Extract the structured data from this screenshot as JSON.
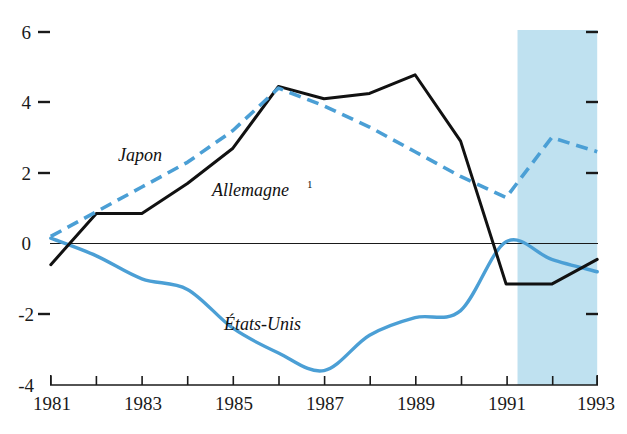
{
  "chart_data": {
    "type": "line",
    "title": "",
    "subtitle": "",
    "xlabel": "",
    "ylabel": "",
    "xlim": [
      1981,
      1993
    ],
    "ylim": [
      -4,
      6
    ],
    "grid": false,
    "legend_position": "inline-annotations",
    "x": [
      1981,
      1982,
      1983,
      1984,
      1985,
      1986,
      1987,
      1988,
      1989,
      1990,
      1991,
      1992,
      1993
    ],
    "xtick_labels": [
      "1981",
      "1983",
      "1985",
      "1987",
      "1989",
      "1991",
      "1993"
    ],
    "xtick_values": [
      1981,
      1983,
      1985,
      1987,
      1989,
      1991,
      1993
    ],
    "ytick_labels": [
      "6",
      "4",
      "2",
      "0",
      "-2",
      "-4"
    ],
    "ytick_values": [
      6,
      4,
      2,
      0,
      -2,
      -4
    ],
    "series": [
      {
        "name": "Japon",
        "style": "dashed",
        "color": "#4b9fd5",
        "values": [
          0.2,
          0.9,
          1.6,
          2.3,
          3.2,
          4.4,
          3.9,
          3.3,
          2.6,
          1.9,
          1.3,
          3.0,
          2.6
        ]
      },
      {
        "name": "Allemagne",
        "footnote": "1",
        "style": "solid",
        "color": "#111111",
        "values": [
          -0.6,
          0.85,
          0.85,
          1.7,
          2.7,
          4.45,
          4.1,
          4.25,
          4.78,
          2.9,
          -1.15,
          -1.15,
          -0.45
        ]
      },
      {
        "name": "États-Unis",
        "style": "solid",
        "color": "#4b9fd5",
        "values": [
          0.15,
          -0.35,
          -1.0,
          -1.3,
          -2.4,
          -3.1,
          -3.6,
          -2.6,
          -2.1,
          -1.9,
          0.05,
          -0.45,
          -0.8
        ]
      }
    ],
    "annotations": [
      {
        "text": "Japon",
        "x": 1982.6,
        "y": 2.55
      },
      {
        "text": "Allemagne",
        "footnote": "1",
        "x": 1985.0,
        "y": 1.55
      },
      {
        "text": "États-Unis",
        "x": 1985.6,
        "y": -2.35
      }
    ],
    "shaded_region": {
      "label": "forecast",
      "x_start": 1991.25,
      "x_end": 1993.0,
      "color": "#bfe1f0"
    },
    "zero_line": true
  }
}
